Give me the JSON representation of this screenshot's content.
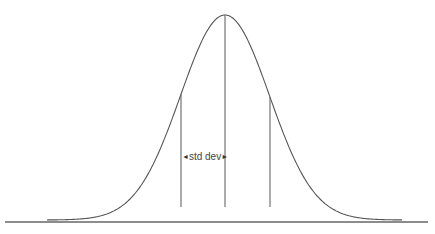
{
  "diagram": {
    "label": "std dev",
    "arrow_left": "◄",
    "arrow_right": "►",
    "colors": {
      "curve": "#555555",
      "lines": "#666666",
      "background": "#ffffff"
    },
    "geometry": {
      "mean_x": 225,
      "sigma_px": 44.5,
      "peak_y": 15,
      "baseline_y": 222,
      "curve_start_x": 47,
      "curve_end_x": 402,
      "tail_y": 219,
      "baseline_x1": 5,
      "baseline_x2": 428,
      "vertical_lines": [
        {
          "name": "minus-one-sd",
          "x": 181,
          "bottom_y": 207
        },
        {
          "name": "mean",
          "x": 225,
          "bottom_y": 207
        },
        {
          "name": "plus-one-sd",
          "x": 270,
          "bottom_y": 207
        }
      ],
      "label_y": 157
    }
  }
}
